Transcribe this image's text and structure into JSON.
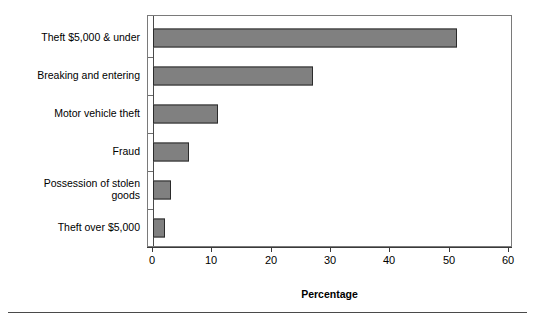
{
  "chart_data": {
    "type": "bar",
    "orientation": "horizontal",
    "title": "",
    "xlabel": "Percentage",
    "ylabel": "",
    "xlim": [
      0,
      60
    ],
    "xticks": [
      0,
      10,
      20,
      30,
      40,
      50,
      60
    ],
    "xtick_labels": [
      "0",
      "10",
      "20",
      "30",
      "40",
      "50",
      "60"
    ],
    "grid": false,
    "legend": null,
    "categories": [
      "Theft $5,000 & under",
      "Breaking and entering",
      "Motor vehicle theft",
      "Fraud",
      "Possession of stolen\ngoods",
      "Theft over $5,000"
    ],
    "values": [
      51.3,
      27,
      11,
      6,
      3,
      2
    ],
    "bar_color": "#808080",
    "bar_edge_color": "#2b2b2b"
  },
  "axis": {
    "x_title": "Percentage"
  }
}
